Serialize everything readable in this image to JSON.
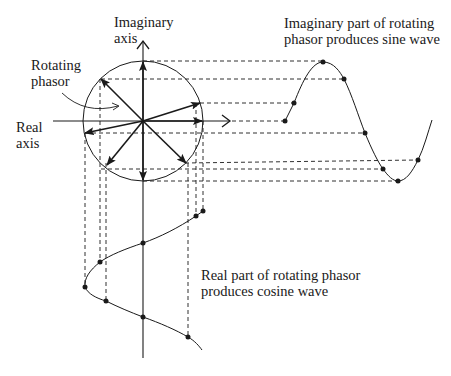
{
  "labels": {
    "imag_axis_1": "Imaginary",
    "imag_axis_2": "axis",
    "rotating_1": "Rotating",
    "rotating_2": "phasor",
    "real_axis_1": "Real",
    "real_axis_2": "axis",
    "sine_caption_1": "Imaginary part of rotating",
    "sine_caption_2": "phasor produces sine wave",
    "cos_caption_1": "Real part of rotating phasor",
    "cos_caption_2": "produces cosine wave"
  },
  "colors": {
    "ink": "#1a1a1a",
    "background": "#ffffff"
  },
  "geometry": {
    "circle": {
      "cx": 143,
      "cy": 121,
      "r": 60
    },
    "phasor_angles_deg": [
      0,
      30,
      90,
      135,
      195,
      225,
      270,
      315
    ],
    "sine_dots": [
      [
        285,
        121
      ],
      [
        294,
        103
      ],
      [
        323,
        62
      ],
      [
        344,
        79
      ],
      [
        365,
        133
      ],
      [
        383,
        169
      ],
      [
        398,
        181
      ],
      [
        418,
        160
      ]
    ],
    "cosine_dots": [
      [
        203,
        211
      ],
      [
        196,
        216
      ],
      [
        143,
        243
      ],
      [
        100,
        262
      ],
      [
        85,
        287
      ],
      [
        106,
        301
      ],
      [
        143,
        317
      ],
      [
        188,
        337
      ]
    ]
  }
}
